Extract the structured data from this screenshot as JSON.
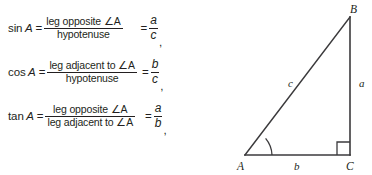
{
  "figure": {
    "background_color": "#ffffff",
    "ink_color": "#231f20",
    "line_color": "#3b3a3c"
  },
  "formulas": [
    {
      "id": "sine",
      "function": "sin",
      "angle": "A",
      "equals": "=",
      "numerator": "leg opposite ∠A",
      "denominator": "hypotenuse",
      "equals2": "=",
      "ratio_numerator": "a",
      "ratio_denominator": "c",
      "trailing": ","
    },
    {
      "id": "cosine",
      "function": "cos",
      "angle": "A",
      "equals": "=",
      "numerator": "leg adjacent to ∠A",
      "denominator": "hypotenuse",
      "equals2": "=",
      "ratio_numerator": "b",
      "ratio_denominator": "c",
      "trailing": ","
    },
    {
      "id": "tangent",
      "function": "tan",
      "angle": "A",
      "equals": "=",
      "numerator": "leg opposite ∠A",
      "denominator": "leg adjacent to ∠A",
      "equals2": "=",
      "ratio_numerator": "a",
      "ratio_denominator": "b",
      "trailing": ","
    }
  ],
  "triangle": {
    "vertices": {
      "a_label": "A",
      "b_label": "B",
      "c_label": "C"
    },
    "sides": {
      "opposite_label": "a",
      "adjacent_label": "b",
      "hypotenuse_label": "c"
    },
    "marks": {
      "right_angle_at": "C",
      "angle_arc_at": "A"
    }
  }
}
